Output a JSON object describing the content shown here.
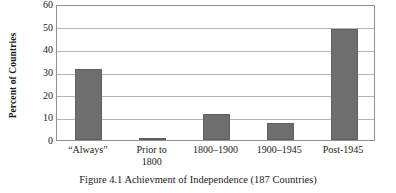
{
  "chart_data": {
    "type": "bar",
    "title": "",
    "caption": "Figure 4.1 Achievment of Independence (187 Countries)",
    "categories": [
      "“Always”",
      "Prior to\n1800",
      "1800–1900",
      "1900–1945",
      "Post-1945"
    ],
    "values": [
      31.5,
      1.0,
      11.5,
      7.3,
      49.0
    ],
    "xlabel": "",
    "ylabel": "Percent of Countries",
    "ylim": [
      0,
      60
    ],
    "ytick_values": [
      0,
      10,
      20,
      30,
      40,
      50,
      60
    ],
    "ytick_labels": [
      "0",
      "10",
      "20",
      "30",
      "40",
      "50",
      "60"
    ],
    "grid": true,
    "legend": false,
    "legend_position": "none",
    "bar_color": "#6e6e6e",
    "grid_color": "#b4b4b4",
    "frame_color": "#8f8f8f",
    "background_color": "#ffffff"
  }
}
